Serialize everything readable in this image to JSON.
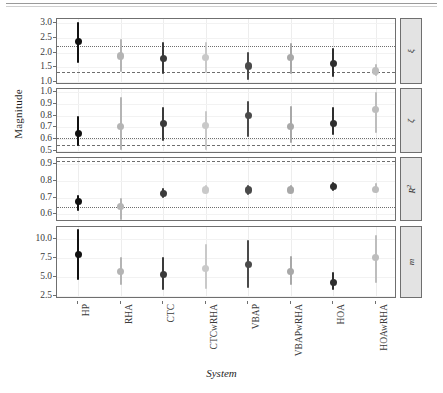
{
  "figure": {
    "y_axis_title": "Magnitude",
    "x_axis_title": "System",
    "caption": ""
  },
  "chart_data": {
    "type": "scatter",
    "title": "",
    "xlabel": "System",
    "ylabel": "Magnitude",
    "categories": [
      "HP",
      "RHA",
      "CTC",
      "CTCwRHA",
      "VBAP",
      "VBAPwRHA",
      "HOA",
      "HOAwRHA"
    ],
    "layout": {
      "facets": 4,
      "facet_direction": "vertical",
      "strip_position": "right",
      "grid": true,
      "legend": "none",
      "error_bars": "vertical whiskers",
      "marker_colors": [
        "#111111",
        "#b4b4b4",
        "#3a3a3a",
        "#c9c9c9",
        "#4a4a4a",
        "#a8a8a8",
        "#2e2e2e",
        "#bdbdbd"
      ]
    },
    "panels": [
      {
        "label": "ξ",
        "label_plain": "xi",
        "ylim": [
          0.9,
          3.15
        ],
        "yticks": [
          "1.0",
          "1.5",
          "2.0",
          "2.5",
          "3.0"
        ],
        "ytick_values": [
          1.0,
          1.5,
          2.0,
          2.5,
          3.0
        ],
        "reference_lines": [
          {
            "style": "dotted",
            "value": 2.22
          },
          {
            "style": "dashed",
            "value": 1.34
          }
        ],
        "values": [
          2.38,
          1.89,
          1.8,
          1.83,
          1.55,
          1.84,
          1.64,
          1.38
        ],
        "lower": [
          1.66,
          1.33,
          1.29,
          1.3,
          1.08,
          1.27,
          1.17,
          1.22
        ],
        "upper": [
          3.05,
          2.46,
          2.38,
          2.37,
          2.02,
          2.33,
          2.16,
          1.61
        ]
      },
      {
        "label": "ζ",
        "label_plain": "zeta",
        "ylim": [
          0.47,
          1.03
        ],
        "yticks": [
          "0.5",
          "0.6",
          "0.7",
          "0.8",
          "0.9",
          "1.0"
        ],
        "ytick_values": [
          0.5,
          0.6,
          0.7,
          0.8,
          0.9,
          1.0
        ],
        "reference_lines": [
          {
            "style": "dotted",
            "value": 0.61
          },
          {
            "style": "dashed",
            "value": 0.545
          }
        ],
        "values": [
          0.645,
          0.705,
          0.73,
          0.715,
          0.8,
          0.71,
          0.735,
          0.85
        ],
        "lower": [
          0.535,
          0.505,
          0.585,
          0.505,
          0.62,
          0.565,
          0.63,
          0.655
        ],
        "upper": [
          0.8,
          0.96,
          0.875,
          0.84,
          0.925,
          0.885,
          0.875,
          1.005
        ]
      },
      {
        "label": "R²",
        "label_plain": "R2",
        "ylim": [
          0.555,
          0.935
        ],
        "yticks": [
          "0.6",
          "0.7",
          "0.8",
          "0.9"
        ],
        "ytick_values": [
          0.6,
          0.7,
          0.8,
          0.9
        ],
        "reference_lines": [
          {
            "style": "dashed",
            "value": 0.915
          },
          {
            "style": "dotted",
            "value": 0.645
          }
        ],
        "values": [
          0.675,
          0.645,
          0.725,
          0.745,
          0.745,
          0.745,
          0.765,
          0.75
        ],
        "lower": [
          0.62,
          0.565,
          0.7,
          0.725,
          0.715,
          0.725,
          0.74,
          0.725
        ],
        "upper": [
          0.715,
          0.7,
          0.755,
          0.775,
          0.775,
          0.775,
          0.795,
          0.785
        ]
      },
      {
        "label": "m",
        "label_plain": "m",
        "ylim": [
          2.1,
          11.6
        ],
        "yticks": [
          "2.5",
          "5.0",
          "7.5",
          "10.0"
        ],
        "ytick_values": [
          2.5,
          5.0,
          7.5,
          10.0
        ],
        "reference_lines": [],
        "values": [
          8.0,
          5.7,
          5.3,
          6.1,
          6.7,
          5.7,
          4.3,
          7.6
        ],
        "lower": [
          4.6,
          4.0,
          3.3,
          3.4,
          3.6,
          3.9,
          3.3,
          4.2
        ],
        "upper": [
          11.3,
          7.7,
          7.6,
          9.3,
          9.9,
          7.8,
          5.7,
          10.6
        ]
      }
    ]
  }
}
